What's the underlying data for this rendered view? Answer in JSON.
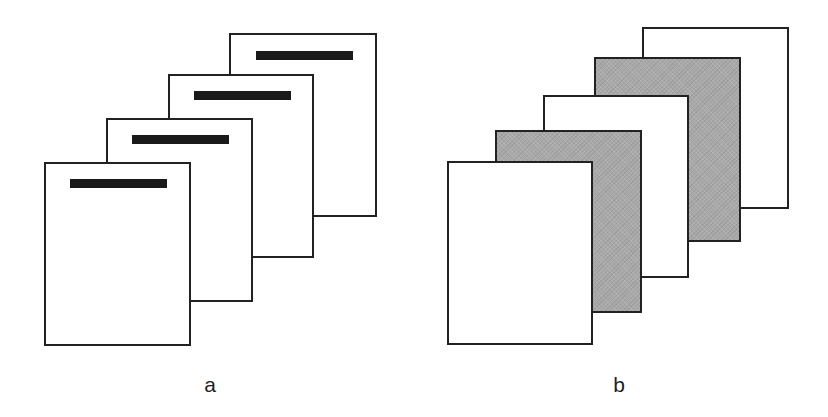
{
  "diagram": {
    "colors": {
      "border": "#222222",
      "white_page": "#ffffff",
      "gray_page": "#a9a9a9",
      "title_bar": "#1a1a1a"
    },
    "group_a": {
      "label": "a",
      "label_pos": {
        "x": 210,
        "y": 374
      },
      "pages": [
        {
          "x": 44,
          "y": 162,
          "w": 147,
          "h": 184,
          "fill": "white",
          "bar": {
            "dx": 26,
            "dy": 17,
            "w": 97,
            "h": 9
          }
        },
        {
          "x": 106,
          "y": 118,
          "w": 147,
          "h": 184,
          "fill": "white",
          "bar": {
            "dx": 26,
            "dy": 17,
            "w": 97,
            "h": 9
          }
        },
        {
          "x": 168,
          "y": 74,
          "w": 146,
          "h": 184,
          "fill": "white",
          "bar": {
            "dx": 26,
            "dy": 17,
            "w": 97,
            "h": 9
          }
        },
        {
          "x": 229,
          "y": 33,
          "w": 148,
          "h": 184,
          "fill": "white",
          "bar": {
            "dx": 27,
            "dy": 18,
            "w": 97,
            "h": 9
          }
        }
      ]
    },
    "group_b": {
      "label": "b",
      "label_pos": {
        "x": 619,
        "y": 374
      },
      "pages": [
        {
          "x": 447,
          "y": 161,
          "w": 146,
          "h": 184,
          "fill": "white"
        },
        {
          "x": 495,
          "y": 130,
          "w": 147,
          "h": 183,
          "fill": "gray"
        },
        {
          "x": 543,
          "y": 95,
          "w": 146,
          "h": 183,
          "fill": "white"
        },
        {
          "x": 594,
          "y": 57,
          "w": 147,
          "h": 185,
          "fill": "gray"
        },
        {
          "x": 642,
          "y": 27,
          "w": 147,
          "h": 182,
          "fill": "white"
        }
      ]
    }
  }
}
